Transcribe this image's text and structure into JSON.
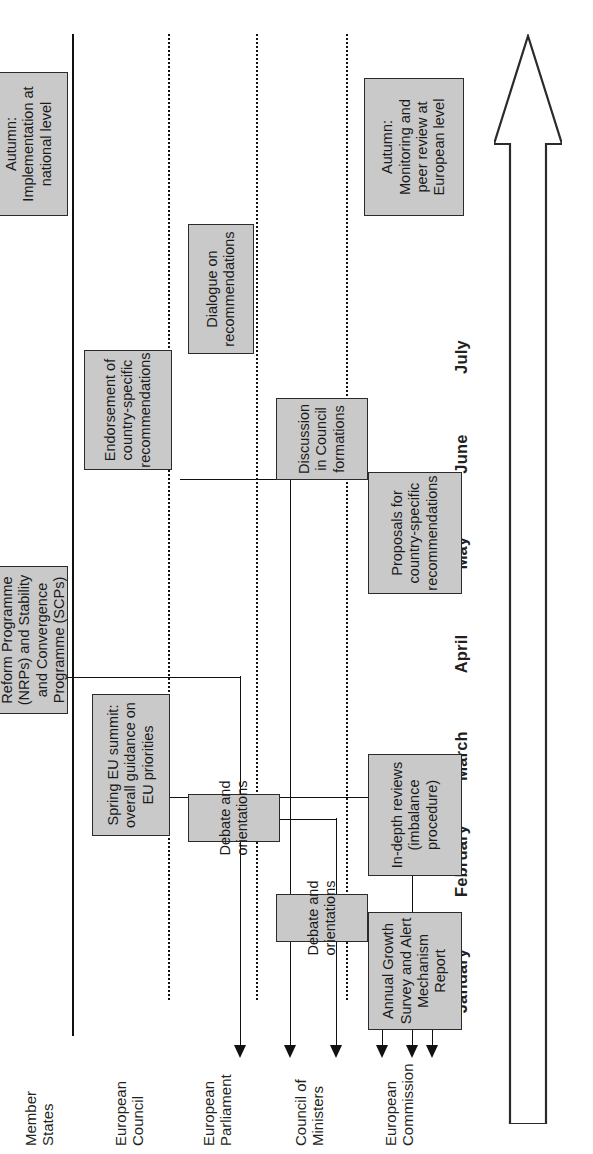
{
  "diagram": {
    "time_arrow": {
      "name": "time-direction-arrow",
      "direction": "left-to-right"
    },
    "accent_colors": {
      "box_fill": "#c9c9c9",
      "box_stroke": "#2b2b2b",
      "line": "#111111",
      "text": "#231f20"
    },
    "months": [
      "January",
      "February",
      "March",
      "April",
      "May",
      "June",
      "July"
    ],
    "lanes": [
      {
        "id": "european-commission",
        "label": "European\nCommission"
      },
      {
        "id": "council-of-ministers",
        "label": "Council of\nMinisters"
      },
      {
        "id": "european-parliament",
        "label": "European\nParliament"
      },
      {
        "id": "european-council",
        "label": "European\nCouncil"
      },
      {
        "id": "member-states",
        "label": "Member\nStates"
      }
    ],
    "boxes": [
      {
        "id": "annual-growth-survey",
        "lane": "european-commission",
        "month": "January",
        "text": "Annual Growth\nSurvey and Alert\nMechanism Report"
      },
      {
        "id": "in-depth-reviews",
        "lane": "european-commission",
        "month": "February-March",
        "text": "In-depth reviews\n(imbalance\nprocedure)"
      },
      {
        "id": "proposals-country-specific-recommendations",
        "lane": "european-commission",
        "month": "May-June",
        "text": "Proposals for\ncountry-specific\nrecommendations"
      },
      {
        "id": "autumn-monitoring-peer-review",
        "lane": "european-commission",
        "month": "Autumn",
        "text": "Autumn:\nMonitoring and\npeer review at\nEuropean level"
      },
      {
        "id": "council-debate-and-orientations",
        "lane": "council-of-ministers",
        "month": "February",
        "text": "Debate and\norientations"
      },
      {
        "id": "discussion-in-council-formations",
        "lane": "council-of-ministers",
        "month": "June-July",
        "text": "Discussion\nin Council\nformations"
      },
      {
        "id": "parliament-debate-and-orientations",
        "lane": "european-parliament",
        "month": "February",
        "text": "Debate and\norientations"
      },
      {
        "id": "dialogue-on-recommendations",
        "lane": "european-parliament",
        "month": "July",
        "text": "Dialogue on\nrecommendations"
      },
      {
        "id": "spring-eu-summit",
        "lane": "european-council",
        "month": "February-March",
        "text": "Spring EU summit:\noverall guidance on\nEU priorities"
      },
      {
        "id": "endorsement-country-specific-recommendations",
        "lane": "european-council",
        "month": "June-July",
        "text": "Endorsement of\ncountry-specific\nrecommendations"
      },
      {
        "id": "adoption-nrp-scp",
        "lane": "member-states",
        "month": "April-May",
        "text": "Adoption of National\nReform Programme\n(NRPs) and Stability\nand Convergence\nProgramme (SCPs)"
      },
      {
        "id": "autumn-implementation-national",
        "lane": "member-states",
        "month": "Autumn",
        "text": "Autumn:\nImplementation at\nnational level"
      }
    ],
    "flows": [
      {
        "id": "flow-january-agsamr",
        "label": ""
      },
      {
        "id": "flow-february-debates",
        "label": ""
      },
      {
        "id": "flow-march-spring-summit",
        "label": ""
      },
      {
        "id": "flow-april-nrp-scp",
        "label": ""
      },
      {
        "id": "flow-june-proposals",
        "label": ""
      },
      {
        "id": "flow-july-endorsement",
        "label": ""
      }
    ]
  }
}
